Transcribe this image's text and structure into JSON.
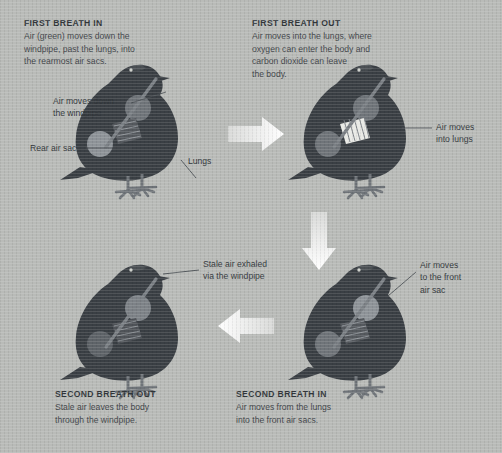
{
  "background_color": "#b9bbb8",
  "silhouette_color": "#3a3f44",
  "organ_color": "#6f7479",
  "highlight_color": "#e9eae6",
  "arrow_color": "#f0f1ee",
  "text_color": "#3b3f42",
  "panels": [
    {
      "id": "first-breath-in",
      "title": "FIRST BREATH IN",
      "body": "Air (green) moves down the\nwindpipe, past the lungs, into\nthe rearmost air sacs."
    },
    {
      "id": "first-breath-out",
      "title": "FIRST BREATH OUT",
      "body": "Air moves into the lungs, where\noxygen can enter the body and\ncarbon dioxide can leave\nthe body."
    },
    {
      "id": "second-breath-out",
      "title": "SECOND BREATH OUT",
      "body": "Stale air leaves the body\nthrough the windpipe."
    },
    {
      "id": "second-breath-in",
      "title": "SECOND BREATH IN",
      "body": "Air moves from the lungs\ninto the front air sacs."
    }
  ],
  "callouts": [
    {
      "id": "windpipe",
      "text": "Air moves down\nthe windpipe"
    },
    {
      "id": "rear-air-sac",
      "text": "Rear air sac"
    },
    {
      "id": "lungs",
      "text": "Lungs"
    },
    {
      "id": "air-into-lungs",
      "text": "Air moves\ninto lungs"
    },
    {
      "id": "stale-air",
      "text": "Stale air exhaled\nvia the windpipe"
    },
    {
      "id": "front-air-sac",
      "text": "Air moves\nto the front\nair sac"
    }
  ],
  "arrows": [
    {
      "id": "arrow-right",
      "direction": "right"
    },
    {
      "id": "arrow-down",
      "direction": "down"
    },
    {
      "id": "arrow-left",
      "direction": "left"
    }
  ],
  "birds": [
    {
      "id": "bird-first-breath-in",
      "stage": "first breath in",
      "highlight": "rear-air-sac"
    },
    {
      "id": "bird-first-breath-out",
      "stage": "first breath out",
      "highlight": "lungs"
    },
    {
      "id": "bird-second-breath-out",
      "stage": "second breath out",
      "highlight": "none"
    },
    {
      "id": "bird-second-breath-in",
      "stage": "second breath in",
      "highlight": "front-air-sac"
    }
  ]
}
